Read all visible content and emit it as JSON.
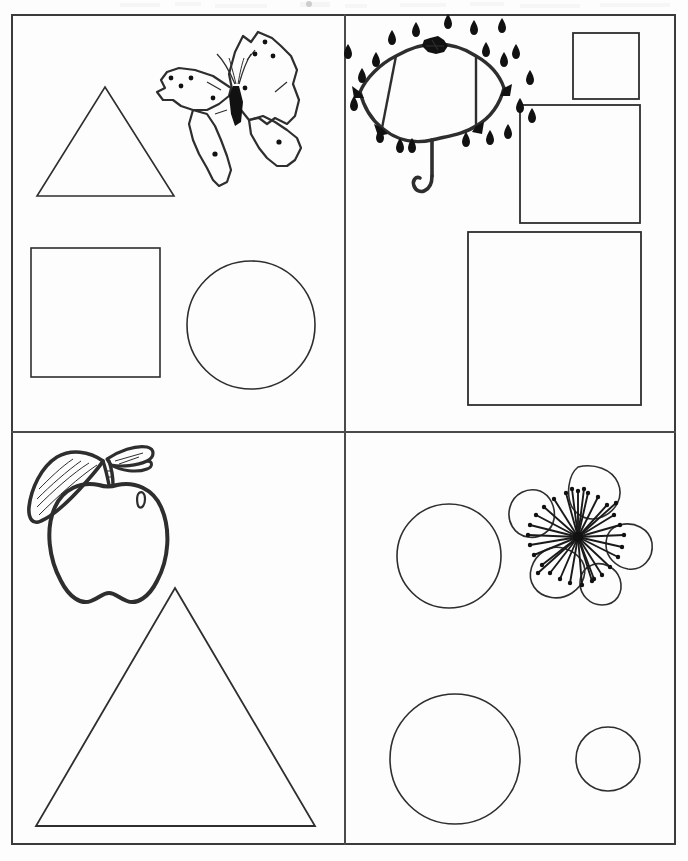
{
  "document": {
    "kind": "worksheet",
    "title": "Shapes and Pictures Worksheet",
    "page_width": 688,
    "page_height": 861,
    "background_color": "#fdfdfd",
    "ink_color": "#2e2e2e",
    "frame": {
      "x": 11,
      "y": 14,
      "width": 665,
      "height": 831,
      "border_width": 2,
      "border_color": "#3b3b3b"
    },
    "dividers": {
      "vertical_x": 344,
      "horizontal_y": 431,
      "color": "#4a4a4a",
      "thickness": 2
    }
  },
  "quadrants": [
    {
      "id": "top-left",
      "x": 13,
      "y": 16,
      "width": 331,
      "height": 415,
      "illustration": "butterfly",
      "shapes": [
        {
          "type": "triangle",
          "label": "triangle",
          "cx": 105,
          "cy": 145,
          "width": 135,
          "height": 110
        },
        {
          "type": "square",
          "label": "square",
          "x": 31,
          "y": 248,
          "size": 129
        },
        {
          "type": "circle",
          "label": "circle",
          "cx": 251,
          "cy": 325,
          "r": 64
        }
      ]
    },
    {
      "id": "top-right",
      "x": 346,
      "y": 16,
      "width": 330,
      "height": 415,
      "illustration": "umbrella-with-raindrops",
      "shapes": [
        {
          "type": "square",
          "label": "small-square",
          "x": 573,
          "y": 33,
          "size": 66
        },
        {
          "type": "square",
          "label": "medium-square",
          "x": 520,
          "y": 105,
          "size": 120
        },
        {
          "type": "square",
          "label": "large-square",
          "x": 468,
          "y": 232,
          "size": 173
        }
      ]
    },
    {
      "id": "bottom-left",
      "x": 13,
      "y": 433,
      "width": 331,
      "height": 412,
      "illustration": "apple",
      "shapes": [
        {
          "type": "triangle",
          "label": "large-triangle",
          "apex_x": 175,
          "apex_y": 588,
          "base_y": 826,
          "base_left_x": 36,
          "base_right_x": 315
        }
      ]
    },
    {
      "id": "bottom-right",
      "x": 346,
      "y": 433,
      "width": 330,
      "height": 412,
      "illustration": "flower",
      "shapes": [
        {
          "type": "circle",
          "label": "circle-top",
          "cx": 449,
          "cy": 556,
          "r": 52
        },
        {
          "type": "circle",
          "label": "circle-large",
          "cx": 455,
          "cy": 759,
          "r": 65
        },
        {
          "type": "circle",
          "label": "circle-small",
          "cx": 608,
          "cy": 759,
          "r": 32
        }
      ]
    }
  ],
  "illustrations": {
    "butterfly": {
      "name": "butterfly-illustration",
      "x": 155,
      "y": 30,
      "width": 150,
      "height": 145,
      "description": "Line-art butterfly with spotted wings and antennae"
    },
    "umbrella": {
      "name": "umbrella-illustration",
      "x": 352,
      "y": 26,
      "width": 160,
      "height": 140,
      "description": "Open umbrella with hooked handle surrounded by raindrops",
      "raindrop_count": 21
    },
    "apple": {
      "name": "apple-illustration",
      "x": 26,
      "y": 441,
      "width": 145,
      "height": 160,
      "description": "Apple with stem and two leaves"
    },
    "flower": {
      "name": "flower-illustration",
      "x": 508,
      "y": 463,
      "width": 132,
      "height": 132,
      "description": "Five-petalled blossom with radiating stamens",
      "petal_count": 5,
      "stamen_count": 30
    }
  },
  "shape_summary": {
    "triangles": 2,
    "squares": 4,
    "circles": 4,
    "pictures": 4
  }
}
